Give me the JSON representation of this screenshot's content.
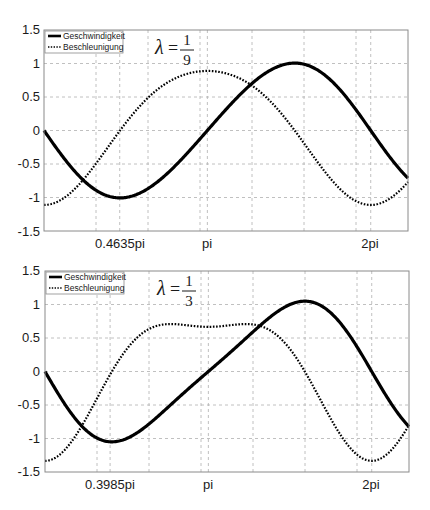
{
  "chart_data": [
    {
      "type": "line",
      "title": "",
      "annotation": {
        "symbol": "λ",
        "equals": "=",
        "numerator": "1",
        "denominator": "9"
      },
      "xlabel": "",
      "ylabel": "",
      "xlim": [
        0,
        7
      ],
      "ylim": [
        -1.5,
        1.5
      ],
      "grid": true,
      "legend_position": "upper left",
      "x_grid_values": [
        1,
        2,
        3,
        4,
        5,
        6,
        1.4561,
        3.1416,
        6.2832
      ],
      "x_tick_labels": [
        {
          "x": 1.4561,
          "label": "0.4635pi"
        },
        {
          "x": 3.1416,
          "label": "pi"
        },
        {
          "x": 6.2832,
          "label": "2pi"
        }
      ],
      "y_ticks": [
        1.5,
        1,
        0.5,
        0,
        -0.5,
        -1,
        -1.5
      ],
      "y_tick_labels": [
        "1.5",
        "1",
        "0.5",
        "0",
        "-0.5",
        "-1",
        "-1.5"
      ],
      "lambda": 0.1111,
      "series": [
        {
          "name": "Geschwindigkeit",
          "style": "solid",
          "formula": "-(sin t + lambda/2 * sin 2t)",
          "key_points": [
            [
              0,
              0
            ],
            [
              1.4561,
              -1.0
            ],
            [
              3.1416,
              0
            ],
            [
              4.827,
              1.0
            ],
            [
              6.2832,
              0
            ],
            [
              7,
              -0.7
            ]
          ]
        },
        {
          "name": "Beschleunigung",
          "style": "dotted",
          "formula": "-(cos t + lambda * cos 2t)",
          "key_points": [
            [
              0,
              -1.11
            ],
            [
              1.46,
              0
            ],
            [
              3.1416,
              0.89
            ],
            [
              4.83,
              0
            ],
            [
              6.2832,
              -1.11
            ],
            [
              7,
              -0.7
            ]
          ]
        }
      ]
    },
    {
      "type": "line",
      "title": "",
      "annotation": {
        "symbol": "λ",
        "equals": "=",
        "numerator": "1",
        "denominator": "3"
      },
      "xlabel": "",
      "ylabel": "",
      "xlim": [
        0,
        7
      ],
      "ylim": [
        -1.5,
        1.5
      ],
      "grid": true,
      "legend_position": "upper left",
      "x_grid_values": [
        1,
        2,
        3,
        4,
        5,
        6,
        1.2519,
        3.1416,
        6.2832
      ],
      "x_tick_labels": [
        {
          "x": 1.2519,
          "label": "0.3985pi"
        },
        {
          "x": 3.1416,
          "label": "pi"
        },
        {
          "x": 6.2832,
          "label": "2pi"
        }
      ],
      "y_ticks": [
        1.5,
        1,
        0.5,
        0,
        -0.5,
        -1,
        -1.5
      ],
      "y_tick_labels": [
        "1.5",
        "1",
        "0.5",
        "0",
        "-0.5",
        "-1",
        "-1.5"
      ],
      "lambda": 0.3333,
      "series": [
        {
          "name": "Geschwindigkeit",
          "style": "solid",
          "formula": "-(sin t + lambda/2 * sin 2t)",
          "key_points": [
            [
              0,
              0
            ],
            [
              1.2519,
              -1.07
            ],
            [
              3.1416,
              0
            ],
            [
              5.03,
              1.07
            ],
            [
              6.2832,
              0
            ],
            [
              7,
              -0.82
            ]
          ]
        },
        {
          "name": "Beschleunigung",
          "style": "dotted",
          "formula": "-(cos t + lambda * cos 2t)",
          "key_points": [
            [
              0,
              -1.33
            ],
            [
              1.25,
              0
            ],
            [
              2.3,
              0.69
            ],
            [
              3.1416,
              0.67
            ],
            [
              3.99,
              0.69
            ],
            [
              5.03,
              0
            ],
            [
              6.2832,
              -1.33
            ],
            [
              7,
              -0.82
            ]
          ]
        }
      ]
    }
  ],
  "charts": [
    {
      "legend": {
        "velocity": "Geschwindigkeit",
        "acceleration": "Beschleunigung"
      },
      "lambda_symbol": "λ",
      "equals": "=",
      "numerator": "1",
      "denominator": "9",
      "x_labels": [
        "0.4635pi",
        "pi",
        "2pi"
      ],
      "y_labels": [
        "1.5",
        "1",
        "0.5",
        "0",
        "-0.5",
        "-1",
        "-1.5"
      ]
    },
    {
      "legend": {
        "velocity": "Geschwindigkeit",
        "acceleration": "Beschleunigung"
      },
      "lambda_symbol": "λ",
      "equals": "=",
      "numerator": "1",
      "denominator": "3",
      "x_labels": [
        "0.3985pi",
        "pi",
        "2pi"
      ],
      "y_labels": [
        "1.5",
        "1",
        "0.5",
        "0",
        "-0.5",
        "-1",
        "-1.5"
      ]
    }
  ],
  "colors": {
    "line": "#000000",
    "grid": "#b0b0b0",
    "axis": "#8a8a8a",
    "text": "#1a1a1a"
  }
}
